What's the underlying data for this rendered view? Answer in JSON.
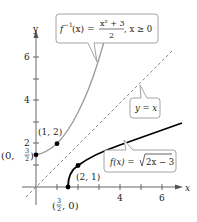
{
  "figure": {
    "axes": {
      "x_label": "x",
      "y_label": "y",
      "x_ticks": [
        {
          "value": 4,
          "label": "4"
        },
        {
          "value": 6,
          "label": "6"
        }
      ],
      "y_ticks": [
        {
          "value": 2,
          "label": "2"
        },
        {
          "value": 4,
          "label": "4"
        },
        {
          "value": 6,
          "label": "6"
        }
      ]
    },
    "curves": {
      "f": {
        "label_name": "f(x) = ",
        "label_radical": "2x − 3",
        "color": "#000000"
      },
      "f_inverse": {
        "label_lhs": "f",
        "label_sup": "−1",
        "label_arg": "(x) = ",
        "label_num": "x² + 3",
        "label_den": "2",
        "label_cond": ", x ≥ 0",
        "color": "#9a9a9a"
      },
      "identity": {
        "label": "y = x",
        "color": "#8a8a8a"
      }
    },
    "points": [
      {
        "name": "point-1-2",
        "label": "(1, 2)"
      },
      {
        "name": "point-0-3half",
        "label_pre": "(0, ",
        "num": "3",
        "den": "2",
        "label_post": ")"
      },
      {
        "name": "point-2-1",
        "label": "(2, 1)"
      },
      {
        "name": "point-3half-0",
        "label_pre": "(",
        "num": "3",
        "den": "2",
        "label_post": ", 0)"
      }
    ]
  }
}
